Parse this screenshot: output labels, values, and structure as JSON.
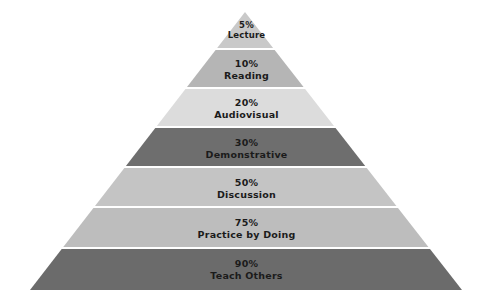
{
  "chart_data": {
    "type": "pyramid",
    "title": "",
    "xlabel": "",
    "ylabel": "",
    "categories": [
      "Lecture",
      "Reading",
      "Audiovisual",
      "Demonstrative",
      "Discussion",
      "Practice by Doing",
      "Teach Others"
    ],
    "values": [
      5,
      10,
      20,
      30,
      50,
      75,
      90
    ],
    "value_labels": [
      "5%",
      "10%",
      "20%",
      "30%",
      "50%",
      "75%",
      "90%"
    ],
    "orientation": "apex-top",
    "grid": false,
    "legend": "none"
  },
  "figure": {
    "background": "#ffffff",
    "divider_color": "#ffffff",
    "label_color": "#1b1b1b",
    "geometry": {
      "apex_x": 245,
      "apex_y": 12,
      "base_left_x": 30,
      "base_right_x": 462,
      "base_y": 290
    }
  },
  "tiers": [
    {
      "percent": "5%",
      "name": "Lecture",
      "color": "#c9c9c9",
      "top": 12,
      "bottom": 48,
      "label_y": 20
    },
    {
      "percent": "10%",
      "name": "Reading",
      "color": "#b5b5b5",
      "top": 50,
      "bottom": 87,
      "label_y": 58
    },
    {
      "percent": "20%",
      "name": "Audiovisual",
      "color": "#dcdcdc",
      "top": 89,
      "bottom": 126,
      "label_y": 97
    },
    {
      "percent": "30%",
      "name": "Demonstrative",
      "color": "#6e6e6e",
      "top": 128,
      "bottom": 166,
      "label_y": 137
    },
    {
      "percent": "50%",
      "name": "Discussion",
      "color": "#c4c4c4",
      "top": 168,
      "bottom": 206,
      "label_y": 177
    },
    {
      "percent": "75%",
      "name": "Practice by Doing",
      "color": "#bdbdbd",
      "top": 208,
      "bottom": 247,
      "label_y": 217
    },
    {
      "percent": "90%",
      "name": "Teach Others",
      "color": "#6b6b6b",
      "top": 249,
      "bottom": 290,
      "label_y": 258
    }
  ]
}
